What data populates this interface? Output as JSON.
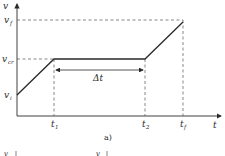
{
  "diagram": {
    "caption": "a)",
    "axes": {
      "y_label": "v",
      "x_label": "t"
    },
    "y_ticks": [
      {
        "label_base": "v",
        "label_sub": "f",
        "y": 20
      },
      {
        "label_base": "v",
        "label_sub": "cr",
        "y": 59
      },
      {
        "label_base": "v",
        "label_sub": "i",
        "y": 95
      }
    ],
    "x_ticks": [
      {
        "label_base": "t",
        "label_sub": "1",
        "x": 54
      },
      {
        "label_base": "t",
        "label_sub": "2",
        "x": 145
      },
      {
        "label_base": "t",
        "label_sub": "f",
        "x": 183
      }
    ],
    "curve_points": [
      [
        17,
        95
      ],
      [
        54,
        59
      ],
      [
        145,
        59
      ],
      [
        183,
        22
      ]
    ],
    "interval": {
      "label": "Δt",
      "from": "t1",
      "to": "t2"
    },
    "next_figure_partial": [
      {
        "label": "v",
        "x": 4
      },
      {
        "label": "v",
        "x": 96
      }
    ],
    "colors": {
      "ink": "#2a2a2a",
      "dashed": "#555555",
      "background": "#ffffff"
    }
  }
}
